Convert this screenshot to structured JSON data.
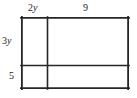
{
  "figure": {
    "kind": "partitioned-rectangle-diagram",
    "stroke_color": "#262626",
    "background_color": "#ffffff",
    "outer": {
      "x": 21,
      "y": 17,
      "width": 108,
      "height": 72
    },
    "vertical_divider_x": 47,
    "horizontal_divider_y": 65,
    "labels": {
      "top_left": {
        "text": "2y",
        "coefficient": "2",
        "variable": "y"
      },
      "top_right": {
        "text": "9",
        "coefficient": "9",
        "variable": ""
      },
      "left_upper": {
        "text": "3y",
        "coefficient": "3",
        "variable": "y"
      },
      "left_lower": {
        "text": "5",
        "coefficient": "5",
        "variable": ""
      }
    }
  }
}
